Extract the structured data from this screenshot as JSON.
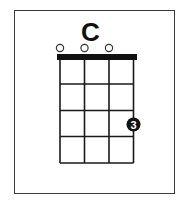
{
  "chord": {
    "name": "C",
    "instrument_strings": 4,
    "frets_shown": 4,
    "open_strings": [
      1,
      2,
      3
    ],
    "fingers": [
      {
        "string": 4,
        "fret": 3,
        "label": "3"
      }
    ]
  },
  "colors": {
    "line": "#1a1a1a",
    "nut": "#111111",
    "frame": "#3a3a3a",
    "dot_fill": "#111111",
    "dot_text": "#ffffff",
    "open_circle": "#333333"
  }
}
